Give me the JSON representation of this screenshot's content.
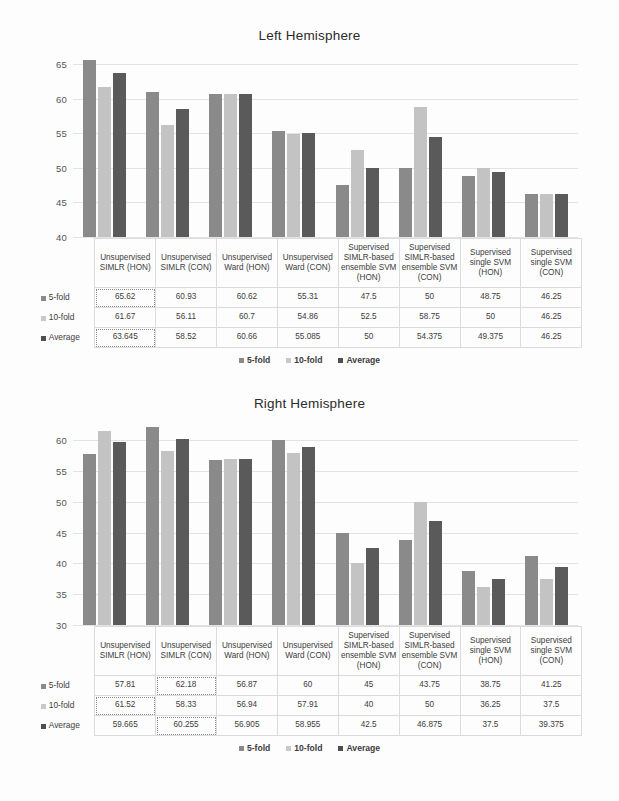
{
  "figure": {
    "categories": [
      "Unsupervised SIMLR (HON)",
      "Unsupervised SIMLR (CON)",
      "Unsupervised Ward  (HON)",
      "Unsupervised Ward (CON)",
      "Supervised SIMLR-based ensemble SVM (HON)",
      "Supervised SIMLR-based ensemble SVM (CON)",
      "Supervised single SVM (HON)",
      "Supervised single SVM (CON)"
    ],
    "series_names": [
      "5-fold",
      "10-fold",
      "Average"
    ],
    "legend": {
      "items": [
        {
          "label": "5-fold",
          "color": "#8a8a8a"
        },
        {
          "label": "10-fold",
          "color": "#c9c9c9"
        },
        {
          "label": "Average",
          "color": "#4f4f4f"
        }
      ]
    }
  },
  "chart_data": [
    {
      "type": "bar",
      "title": "Left Hemisphere",
      "xlabel": "",
      "ylabel": "",
      "ylim": [
        40,
        66
      ],
      "yticks": [
        40,
        45,
        50,
        55,
        60,
        65
      ],
      "grid": true,
      "legend_position": "bottom",
      "categories": [
        "Unsupervised SIMLR (HON)",
        "Unsupervised SIMLR (CON)",
        "Unsupervised Ward  (HON)",
        "Unsupervised Ward (CON)",
        "Supervised SIMLR-based ensemble SVM (HON)",
        "Supervised SIMLR-based ensemble SVM (CON)",
        "Supervised single SVM (HON)",
        "Supervised single SVM (CON)"
      ],
      "series": [
        {
          "name": "5-fold",
          "values": [
            65.62,
            60.93,
            60.62,
            55.31,
            47.5,
            50,
            48.75,
            46.25
          ]
        },
        {
          "name": "10-fold",
          "values": [
            61.67,
            56.11,
            60.7,
            54.86,
            52.5,
            58.75,
            50,
            46.25
          ]
        },
        {
          "name": "Average",
          "values": [
            63.645,
            58.52,
            60.66,
            55.085,
            50,
            54.375,
            49.375,
            46.25
          ]
        }
      ],
      "highlight_cells": [
        [
          0,
          0
        ],
        [
          2,
          0
        ]
      ]
    },
    {
      "type": "bar",
      "title": "Right Hemisphere",
      "xlabel": "",
      "ylabel": "",
      "ylim": [
        30,
        62.5
      ],
      "yticks": [
        30,
        35,
        40,
        45,
        50,
        55,
        60
      ],
      "grid": true,
      "legend_position": "bottom",
      "categories": [
        "Unsupervised SIMLR (HON)",
        "Unsupervised SIMLR (CON)",
        "Unsupervised Ward  (HON)",
        "Unsupervised Ward (CON)",
        "Supervised SIMLR-based ensemble SVM (HON)",
        "Supervised SIMLR-based ensemble SVM (CON)",
        "Supervised single SVM (HON)",
        "Supervised single SVM (CON)"
      ],
      "series": [
        {
          "name": "5-fold",
          "values": [
            57.81,
            62.18,
            56.87,
            60,
            45,
            43.75,
            38.75,
            41.25
          ]
        },
        {
          "name": "10-fold",
          "values": [
            61.52,
            58.33,
            56.94,
            57.91,
            40,
            50,
            36.25,
            37.5
          ]
        },
        {
          "name": "Average",
          "values": [
            59.665,
            60.255,
            56.905,
            58.955,
            42.5,
            46.875,
            37.5,
            39.375
          ]
        }
      ],
      "highlight_cells": [
        [
          0,
          1
        ],
        [
          1,
          0
        ],
        [
          2,
          1
        ]
      ]
    }
  ],
  "tables": [
    {
      "headers": [
        "Unsupervised SIMLR (HON)",
        "Unsupervised SIMLR (CON)",
        "Unsupervised Ward  (HON)",
        "Unsupervised Ward (CON)",
        "Supervised SIMLR-based ensemble SVM (HON)",
        "Supervised SIMLR-based ensemble SVM (CON)",
        "Supervised single SVM (HON)",
        "Supervised single SVM (CON)"
      ],
      "rows": [
        {
          "label": "5-fold",
          "values": [
            "65.62",
            "60.93",
            "60.62",
            "55.31",
            "47.5",
            "50",
            "48.75",
            "46.25"
          ]
        },
        {
          "label": "10-fold",
          "values": [
            "61.67",
            "56.11",
            "60.7",
            "54.86",
            "52.5",
            "58.75",
            "50",
            "46.25"
          ]
        },
        {
          "label": "Average",
          "values": [
            "63.645",
            "58.52",
            "60.66",
            "55.085",
            "50",
            "54.375",
            "49.375",
            "46.25"
          ]
        }
      ]
    },
    {
      "headers": [
        "Unsupervised SIMLR (HON)",
        "Unsupervised SIMLR (CON)",
        "Unsupervised Ward  (HON)",
        "Unsupervised Ward (CON)",
        "Supervised SIMLR-based ensemble SVM (HON)",
        "Supervised SIMLR-based ensemble SVM (CON)",
        "Supervised single SVM (HON)",
        "Supervised single SVM (CON)"
      ],
      "rows": [
        {
          "label": "5-fold",
          "values": [
            "57.81",
            "62.18",
            "56.87",
            "60",
            "45",
            "43.75",
            "38.75",
            "41.25"
          ]
        },
        {
          "label": "10-fold",
          "values": [
            "61.52",
            "58.33",
            "56.94",
            "57.91",
            "40",
            "50",
            "36.25",
            "37.5"
          ]
        },
        {
          "label": "Average",
          "values": [
            "59.665",
            "60.255",
            "56.905",
            "58.955",
            "42.5",
            "46.875",
            "37.5",
            "39.375"
          ]
        }
      ]
    }
  ]
}
